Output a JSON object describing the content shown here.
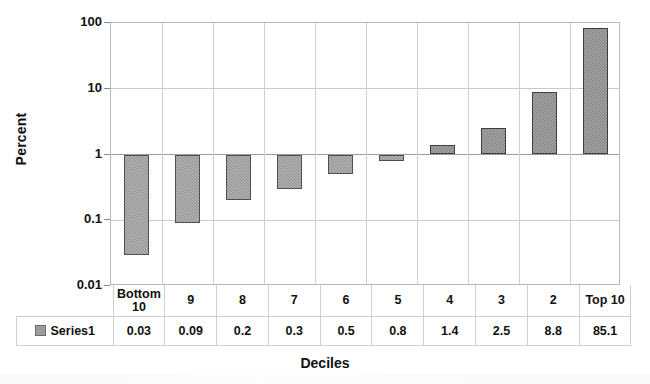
{
  "chart_data": {
    "type": "bar",
    "title": "",
    "xlabel": "Deciles",
    "ylabel": "Percent",
    "yscale": "log",
    "ylim": [
      0.01,
      100
    ],
    "ytick_labels": [
      "100",
      "10",
      "1",
      "0.1",
      "0.01"
    ],
    "ytick_values": [
      100,
      10,
      1,
      0.1,
      0.01
    ],
    "baseline": 1,
    "grid": true,
    "legend_position": "table-bottom-left",
    "categories": [
      "Bottom 10",
      "9",
      "8",
      "7",
      "6",
      "5",
      "4",
      "3",
      "2",
      "Top 10"
    ],
    "series": [
      {
        "name": "Series1",
        "values": [
          0.03,
          0.09,
          0.2,
          0.3,
          0.5,
          0.8,
          1.4,
          2.5,
          8.8,
          85.1
        ],
        "value_labels": [
          "0.03",
          "0.09",
          "0.2",
          "0.3",
          "0.5",
          "0.8",
          "1.4",
          "2.5",
          "8.8",
          "85.1"
        ],
        "color": "#9d9d9d",
        "border_color": "#4f4f4f"
      }
    ]
  },
  "axes": {
    "y_title": "Percent",
    "x_title": "Deciles"
  },
  "data_table": {
    "legend_label": "Series1",
    "header": [
      "Bottom 10",
      "9",
      "8",
      "7",
      "6",
      "5",
      "4",
      "3",
      "2",
      "Top 10"
    ],
    "row": [
      "0.03",
      "0.09",
      "0.2",
      "0.3",
      "0.5",
      "0.8",
      "1.4",
      "2.5",
      "8.8",
      "85.1"
    ]
  },
  "colors": {
    "bar_fill": "#9d9d9d",
    "bar_fill_positive": "#8b8b8b",
    "bar_border": "#4f4f4f",
    "grid": "#c9c9c9",
    "frame": "#b9b9b9",
    "text": "#111111"
  }
}
